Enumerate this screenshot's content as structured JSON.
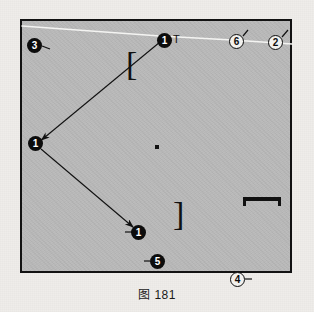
{
  "figure": {
    "caption": "图 181",
    "background_color": "#b9b9b9",
    "page_color": "#efedea",
    "border_color": "#121212",
    "frame": {
      "x": 20,
      "y": 19,
      "width": 272,
      "height": 254
    }
  },
  "markers": [
    {
      "id": "marker-3",
      "label": "3",
      "style": "filled",
      "x": 27,
      "y": 38,
      "tick": "right"
    },
    {
      "id": "marker-1-top",
      "label": "1",
      "style": "filled",
      "x": 157,
      "y": 33,
      "tick": "none"
    },
    {
      "id": "marker-6",
      "label": "6",
      "style": "outline",
      "x": 229,
      "y": 34,
      "tick": "right"
    },
    {
      "id": "marker-2",
      "label": "2",
      "style": "outline",
      "x": 268,
      "y": 35,
      "tick": "right"
    },
    {
      "id": "marker-1-left",
      "label": "1",
      "style": "filled",
      "x": 28,
      "y": 136,
      "tick": "none"
    },
    {
      "id": "marker-1-bottom",
      "label": "1",
      "style": "filled",
      "x": 131,
      "y": 225,
      "tick": "left"
    },
    {
      "id": "marker-5",
      "label": "5",
      "style": "filled",
      "x": 150,
      "y": 254,
      "tick": "left"
    },
    {
      "id": "marker-4",
      "label": "4",
      "style": "outline",
      "x": 230,
      "y": 272,
      "tick": "right"
    }
  ],
  "annotations": {
    "t_label": "T",
    "bracket_upper": "[",
    "bracket_lower": "]",
    "bracket_horizontal": "horizontal-bracket",
    "center_dot": "center-point"
  },
  "arrows": [
    {
      "id": "arrow-top-to-left",
      "from": [
        160,
        42
      ],
      "to": [
        40,
        141
      ]
    },
    {
      "id": "arrow-left-to-bottom",
      "from": [
        41,
        149
      ],
      "to": [
        134,
        228
      ]
    }
  ],
  "guide_line": {
    "id": "white-guide-line",
    "color": "#f4f4f2",
    "points": [
      [
        22,
        26
      ],
      [
        160,
        36
      ],
      [
        232,
        40
      ],
      [
        292,
        44
      ]
    ]
  }
}
